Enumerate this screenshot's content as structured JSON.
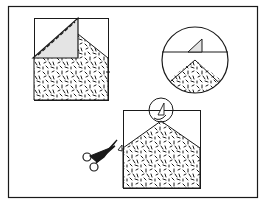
{
  "figure": {
    "type": "instructional-diagram",
    "colors": {
      "line": "#1a1a1a",
      "paper": "#ffffff",
      "fold_shade": "#e4e4e4",
      "pattern_mark": "#1a1a1a"
    },
    "steps": [
      {
        "id": "step-1",
        "label": "Fold corner down to form house shape"
      },
      {
        "id": "step-2",
        "label": "Detail: folded corner tip"
      },
      {
        "id": "step-3",
        "label": "Cut along fold with scissors"
      }
    ]
  }
}
